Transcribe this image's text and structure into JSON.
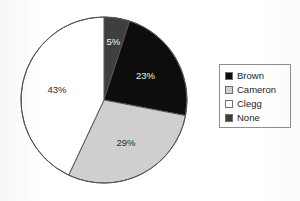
{
  "chart_data": {
    "type": "pie",
    "title": "",
    "categories": [
      "Brown",
      "Cameron",
      "Clegg",
      "None"
    ],
    "values": [
      23,
      29,
      43,
      5
    ],
    "value_labels": [
      "23%",
      "29%",
      "43%",
      "5%"
    ],
    "units": "percent",
    "start_angle_deg": 0,
    "direction": "clockwise",
    "slice_order_from_top": [
      "None",
      "Brown",
      "Cameron",
      "Clegg"
    ],
    "colors": {
      "Brown": "#0d0d0d",
      "Cameron": "#cfcfcf",
      "Clegg": "#ffffff",
      "None": "#3f3f3f"
    },
    "outline_color": "#555555",
    "legend_position": "right",
    "legend_border": true,
    "grid": false,
    "xlabel": "",
    "ylabel": ""
  },
  "slices": [
    {
      "name": "None",
      "label": "5%",
      "value": 5,
      "color": "#3f3f3f",
      "label_tone": "on-dark"
    },
    {
      "name": "Brown",
      "label": "23%",
      "value": 23,
      "color": "#0d0d0d",
      "label_tone": "on-dark"
    },
    {
      "name": "Cameron",
      "label": "29%",
      "value": 29,
      "color": "#cfcfcf",
      "label_tone": "on-light"
    },
    {
      "name": "Clegg",
      "label": "43%",
      "value": 43,
      "color": "#ffffff",
      "label_tone": "on-light"
    }
  ],
  "legend": {
    "items": [
      {
        "label": "Brown",
        "color": "#0d0d0d"
      },
      {
        "label": "Cameron",
        "color": "#cfcfcf"
      },
      {
        "label": "Clegg",
        "color": "#ffffff"
      },
      {
        "label": "None",
        "color": "#3f3f3f"
      }
    ]
  }
}
